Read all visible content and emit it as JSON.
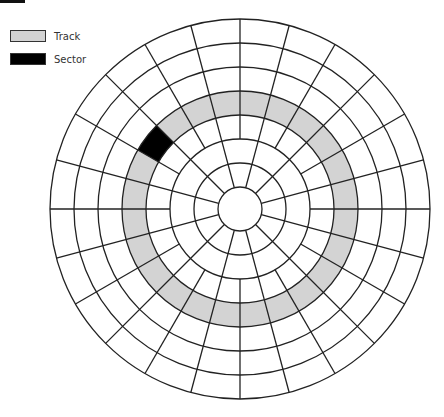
{
  "legend": {
    "items": [
      {
        "label": "Track",
        "color": "#d3d3d3"
      },
      {
        "label": "Sector",
        "color": "#000000"
      }
    ]
  },
  "disk": {
    "center": [
      240,
      209
    ],
    "radii": [
      22,
      46,
      70,
      94,
      118,
      142,
      166,
      190
    ],
    "inner_spokes": {
      "from_r": 22,
      "to_r": 70,
      "count": 12,
      "offset_deg": 15
    },
    "outer_spokes": {
      "from_r": 70,
      "to_r": 190,
      "count": 24,
      "offset_deg": 0
    },
    "track": {
      "inner_r": 94,
      "outer_r": 118,
      "color": "#d3d3d3"
    },
    "sector": {
      "inner_r": 94,
      "outer_r": 118,
      "start_deg": 135,
      "end_deg": 150,
      "color": "#000000"
    },
    "stroke_color": "#222222"
  }
}
